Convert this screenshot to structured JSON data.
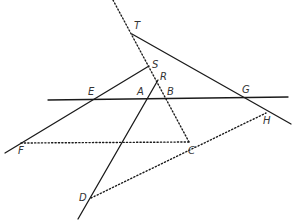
{
  "diagram": {
    "type": "geometric-construction",
    "points": {
      "T": {
        "label": "T",
        "x": 132,
        "y": 34,
        "lx": 134,
        "ly": 29
      },
      "S": {
        "label": "S",
        "x": 149,
        "y": 66,
        "lx": 152,
        "ly": 68
      },
      "R": {
        "label": "R",
        "x": 158,
        "y": 80,
        "lx": 160,
        "ly": 80
      },
      "A": {
        "label": "A",
        "x": 145,
        "y": 99,
        "lx": 137,
        "ly": 95
      },
      "B": {
        "label": "B",
        "x": 165,
        "y": 99,
        "lx": 167,
        "ly": 95
      },
      "E": {
        "label": "E",
        "x": 94,
        "y": 99,
        "lx": 88,
        "ly": 95
      },
      "G": {
        "label": "G",
        "x": 244,
        "y": 98,
        "lx": 242,
        "ly": 93
      },
      "H": {
        "label": "H",
        "x": 266,
        "y": 113,
        "lx": 263,
        "ly": 124
      },
      "C": {
        "label": "C",
        "x": 189,
        "y": 142,
        "lx": 188,
        "ly": 154
      },
      "F": {
        "label": "F",
        "x": 21,
        "y": 143,
        "lx": 18,
        "ly": 154
      },
      "D": {
        "label": "D",
        "x": 91,
        "y": 198,
        "lx": 79,
        "ly": 201
      }
    },
    "solid_lines": [
      {
        "name": "line-EG",
        "x1": 48,
        "y1": 100,
        "x2": 288,
        "y2": 97
      },
      {
        "name": "line-FS",
        "x1": 5,
        "y1": 153,
        "x2": 149,
        "y2": 66
      },
      {
        "name": "line-DR",
        "x1": 78,
        "y1": 219,
        "x2": 158,
        "y2": 80
      },
      {
        "name": "line-TH",
        "x1": 132,
        "y1": 34,
        "x2": 291,
        "y2": 124
      }
    ],
    "dotted_lines": [
      {
        "name": "line-TC",
        "x1": 113,
        "y1": 0,
        "x2": 189,
        "y2": 142
      },
      {
        "name": "line-FC",
        "x1": 21,
        "y1": 143,
        "x2": 189,
        "y2": 142
      },
      {
        "name": "line-DH",
        "x1": 91,
        "y1": 198,
        "x2": 266,
        "y2": 113
      }
    ]
  }
}
